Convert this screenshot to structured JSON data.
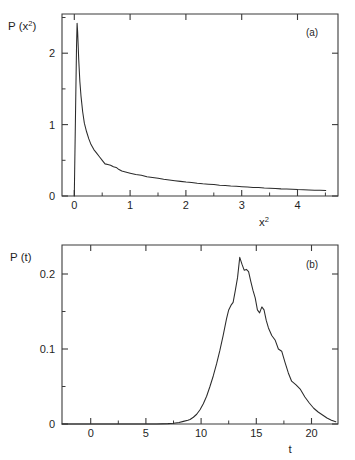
{
  "figure": {
    "title": "",
    "background_color": "#ffffff",
    "line_color": "#2b2b2b",
    "axis_color": "#3b3b3b"
  },
  "chart_data": [
    {
      "type": "line",
      "panel_tag": "(a)",
      "title": "",
      "xlabel": "x2",
      "xlabel_base": "x",
      "xlabel_sup": "2",
      "ylabel": "P(x2)",
      "ylabel_prefix": "P (x",
      "ylabel_sup": "2",
      "ylabel_suffix": ")",
      "xlim": [
        -0.22,
        4.72
      ],
      "ylim": [
        0,
        2.55
      ],
      "grid": false,
      "legend": null,
      "xticks": [
        0,
        1,
        2,
        3,
        4
      ],
      "xticklabels": [
        "0",
        "1",
        "2",
        "3",
        "4"
      ],
      "xticks_minor": [
        0.5,
        1.5,
        2.5,
        3.5,
        4.5
      ],
      "yticks": [
        0,
        1,
        2
      ],
      "yticklabels": [
        "0",
        "1",
        "2"
      ],
      "yticks_minor": [
        0.5,
        1.5,
        2.5
      ],
      "x": [
        0.0,
        0.02,
        0.04,
        0.05,
        0.06,
        0.08,
        0.1,
        0.12,
        0.15,
        0.18,
        0.22,
        0.26,
        0.3,
        0.35,
        0.4,
        0.45,
        0.5,
        0.55,
        0.6,
        0.65,
        0.7,
        0.75,
        0.8,
        0.85,
        0.9,
        0.95,
        1.0,
        1.1,
        1.2,
        1.3,
        1.4,
        1.5,
        1.6,
        1.7,
        1.8,
        1.9,
        2.0,
        2.1,
        2.2,
        2.3,
        2.4,
        2.5,
        2.6,
        2.7,
        2.8,
        2.9,
        3.0,
        3.1,
        3.2,
        3.3,
        3.4,
        3.5,
        3.6,
        3.7,
        3.8,
        3.9,
        4.0,
        4.1,
        4.2,
        4.3,
        4.4,
        4.5
      ],
      "y": [
        0.0,
        1.05,
        2.1,
        2.42,
        2.3,
        1.9,
        1.6,
        1.4,
        1.18,
        1.02,
        0.9,
        0.8,
        0.72,
        0.65,
        0.6,
        0.55,
        0.5,
        0.45,
        0.44,
        0.43,
        0.41,
        0.4,
        0.37,
        0.35,
        0.34,
        0.33,
        0.32,
        0.3,
        0.29,
        0.27,
        0.26,
        0.25,
        0.235,
        0.225,
        0.215,
        0.205,
        0.195,
        0.19,
        0.18,
        0.172,
        0.166,
        0.16,
        0.152,
        0.148,
        0.14,
        0.136,
        0.13,
        0.125,
        0.12,
        0.118,
        0.112,
        0.108,
        0.105,
        0.1,
        0.098,
        0.094,
        0.09,
        0.088,
        0.085,
        0.082,
        0.08,
        0.078
      ],
      "peak": {
        "x": 0.05,
        "y": 2.42
      },
      "description": "Sharply peaked distribution near x2 = 0.05 decaying with a long heavy tail"
    },
    {
      "type": "line",
      "panel_tag": "(b)",
      "title": "",
      "xlabel": "t",
      "ylabel": "P(t)",
      "ylabel_prefix": "P (t)",
      "xlim": [
        -2.6,
        22.4
      ],
      "ylim": [
        0,
        0.2385
      ],
      "grid": false,
      "legend": null,
      "xticks": [
        0,
        5,
        10,
        15,
        20
      ],
      "xticklabels": [
        "0",
        "5",
        "10",
        "15",
        "20"
      ],
      "xticks_minor": [
        2.5,
        7.5,
        12.5,
        17.5
      ],
      "yticks": [
        0,
        0.1,
        0.2
      ],
      "yticklabels": [
        "0",
        "0.1",
        "0.2"
      ],
      "yticks_minor": [
        0.05,
        0.15
      ],
      "x": [
        -2.6,
        0.0,
        2.0,
        4.0,
        6.0,
        7.0,
        7.5,
        8.0,
        8.4,
        8.8,
        9.0,
        9.3,
        9.6,
        9.9,
        10.2,
        10.5,
        10.8,
        11.1,
        11.4,
        11.7,
        12.0,
        12.3,
        12.5,
        12.7,
        12.9,
        13.1,
        13.3,
        13.5,
        13.7,
        13.9,
        14.1,
        14.3,
        14.5,
        14.7,
        14.9,
        15.1,
        15.3,
        15.5,
        15.7,
        15.9,
        16.1,
        16.4,
        16.7,
        17.0,
        17.3,
        17.6,
        17.9,
        18.2,
        18.6,
        19.0,
        19.4,
        19.8,
        20.2,
        20.6,
        21.0,
        21.4,
        21.8,
        22.2
      ],
      "y": [
        0.0,
        0.0,
        0.0,
        0.0,
        0.0,
        0.0005,
        0.001,
        0.002,
        0.0035,
        0.005,
        0.006,
        0.009,
        0.013,
        0.019,
        0.027,
        0.037,
        0.05,
        0.064,
        0.08,
        0.098,
        0.118,
        0.14,
        0.152,
        0.158,
        0.162,
        0.178,
        0.195,
        0.222,
        0.213,
        0.205,
        0.206,
        0.203,
        0.19,
        0.178,
        0.168,
        0.152,
        0.148,
        0.156,
        0.152,
        0.138,
        0.128,
        0.118,
        0.112,
        0.1,
        0.097,
        0.082,
        0.068,
        0.057,
        0.052,
        0.046,
        0.036,
        0.028,
        0.021,
        0.016,
        0.012,
        0.008,
        0.005,
        0.003
      ],
      "peak": {
        "x": 13.5,
        "y": 0.222
      },
      "description": "Broad unimodal distribution peaking near t = 13.5 at P(t) = 0.222 with jagged secondary shoulders"
    }
  ]
}
